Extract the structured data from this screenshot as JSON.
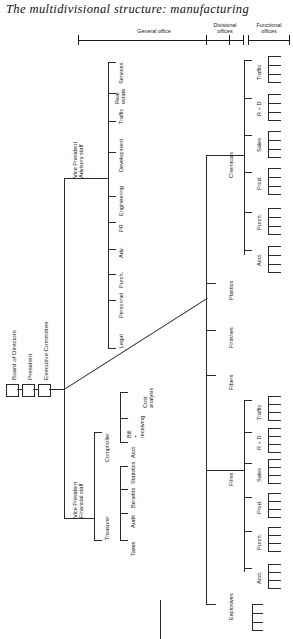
{
  "title": "The multidivisional structure: manufacturing",
  "header_groups": [
    {
      "label": "General office",
      "x": 78,
      "width": 152
    },
    {
      "label": "Divisional\noffices",
      "x": 206,
      "width": 38
    },
    {
      "label": "Functional\noffices",
      "x": 248,
      "width": 42
    }
  ],
  "root_boxes": [
    {
      "label": "Board of Directors",
      "name": "board-of-directors"
    },
    {
      "label": "President",
      "name": "president"
    },
    {
      "label": "Executive Committee",
      "name": "executive-committee"
    }
  ],
  "staff_heads": [
    {
      "label": "Vice President\nAdvisory staff",
      "name": "vp-advisory-staff"
    },
    {
      "label": "Vice President\nFinancial staff",
      "name": "vp-financial-staff"
    }
  ],
  "advisory_staff": [
    "Legal",
    "Personnel",
    "Purch.",
    "Adv.",
    "PR",
    "Engineering",
    "Development",
    "Traffic",
    "Real\nestate",
    "Services"
  ],
  "financial_subheads": [
    {
      "label": "Treasurer",
      "name": "treasurer"
    },
    {
      "label": "Comptroller",
      "name": "comptroller"
    }
  ],
  "treasurer_items": [
    "Taxes",
    "Audit",
    "Benefits",
    "Statistics"
  ],
  "comptroller_items": [
    "Acct.",
    "Bill\n+\nreceiving",
    "Cost\nanalysis"
  ],
  "divisions": [
    {
      "label": "Explosives",
      "name": "division-explosives"
    },
    {
      "label": "Films",
      "name": "division-films"
    },
    {
      "label": "Fibers",
      "name": "division-fibers"
    },
    {
      "label": "Finishes",
      "name": "division-finishes"
    },
    {
      "label": "Plastics",
      "name": "division-plastics"
    },
    {
      "label": "Chemicals",
      "name": "division-chemicals"
    }
  ],
  "functional_offices": [
    "Acct.",
    "Purch.",
    "Prod.",
    "Sales",
    "R + D",
    "Traffic"
  ],
  "colors": {
    "line": "#2a2a2a",
    "text": "#1a1a1a",
    "background": "#ffffff"
  }
}
